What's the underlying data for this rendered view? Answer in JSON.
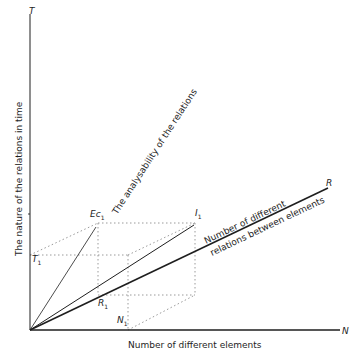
{
  "diagram": {
    "axes": {
      "vertical_end": "T",
      "horizontal_end": "N",
      "diagonal_end": "R",
      "vertical_label": "The nature of the relations in time",
      "horizontal_label": "Number of different elements",
      "diagonal_label_line1": "Number of different",
      "diagonal_label_line2": "relations between elements",
      "steep_label": "The analysability of the relations"
    },
    "points": {
      "T1": {
        "main": "T",
        "sub": "1"
      },
      "Ec1": {
        "main": "Ec",
        "sub": "1"
      },
      "I1": {
        "main": "I",
        "sub": "1"
      },
      "R1": {
        "main": "R",
        "sub": "1"
      },
      "N1": {
        "main": "N",
        "sub": "1"
      }
    },
    "colors": {
      "ink": "#1e1e1e",
      "dotted": "#9a9a9a",
      "background": "#ffffff"
    }
  }
}
